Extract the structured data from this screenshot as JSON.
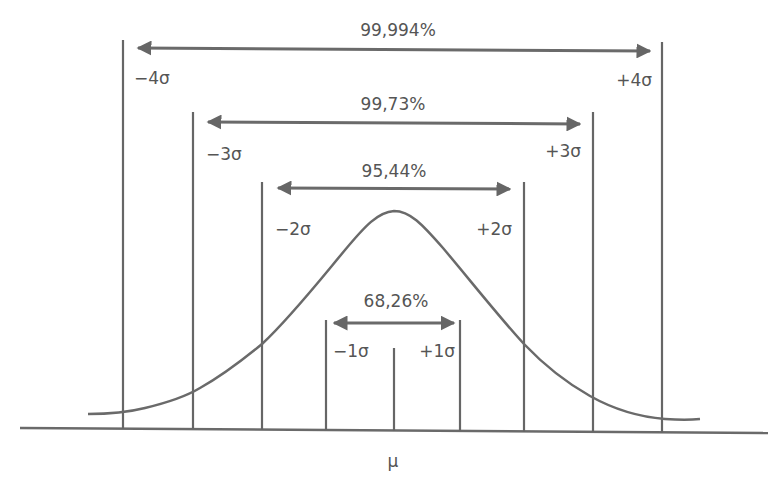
{
  "diagram": {
    "color_line": "#666666",
    "color_text": "#555555",
    "mean_label": "μ",
    "ranges": [
      {
        "id": "1",
        "percent": "68,26%",
        "left_label": "−1σ",
        "right_label": "+1σ"
      },
      {
        "id": "2",
        "percent": "95,44%",
        "left_label": "−2σ",
        "right_label": "+2σ"
      },
      {
        "id": "3",
        "percent": "99,73%",
        "left_label": "−3σ",
        "right_label": "+3σ"
      },
      {
        "id": "4",
        "percent": "99,994%",
        "left_label": "−4σ",
        "right_label": "+4σ"
      }
    ]
  }
}
